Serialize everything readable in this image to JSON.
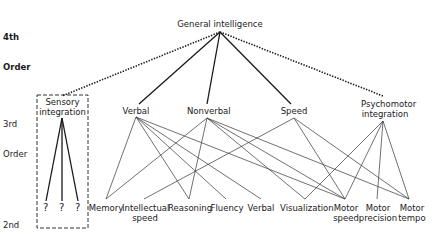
{
  "diagram": {
    "orders": {
      "fourth": {
        "line1": "4th",
        "line2": "Order"
      },
      "third": {
        "line1": "3rd",
        "line2": "Order"
      },
      "second": {
        "line1": "2nd",
        "line2": "Order"
      }
    },
    "fourth_order": {
      "general": "General intelligence"
    },
    "third_order": {
      "sensory": {
        "line1": "Sensory",
        "line2": "integration"
      },
      "verbal": "Verbal",
      "nonverbal": "Nonverbal",
      "speed": "Speed",
      "psychomotor": {
        "line1": "Psychomotor",
        "line2": "integration"
      }
    },
    "second_order": {
      "unknown": [
        "?",
        "?",
        "?"
      ],
      "memory": "Memory",
      "intellectual_speed": {
        "line1": "Intellectual",
        "line2": "speed"
      },
      "reasoning": "Reasoning",
      "fluency": "Fluency",
      "verbal": "Verbal",
      "visualization": "Visualization",
      "motor_speed": {
        "line1": "Motor",
        "line2": "speed"
      },
      "motor_precision": {
        "line1": "Motor",
        "line2": "precision"
      },
      "motor_tempo": {
        "line1": "Motor",
        "line2": "tempo"
      }
    },
    "connections": {
      "general_solid": [
        "Verbal",
        "Nonverbal",
        "Speed"
      ],
      "general_dotted": [
        "Sensory integration",
        "Psychomotor integration"
      ],
      "verbal": [
        "Memory",
        "Reasoning",
        "Fluency",
        "Verbal",
        "Motor speed"
      ],
      "nonverbal": [
        "Memory",
        "Reasoning",
        "Visualization",
        "Motor speed",
        "Motor tempo"
      ],
      "speed": [
        "Intellectual speed",
        "Motor speed",
        "Motor tempo"
      ],
      "psychomotor": [
        "Visualization",
        "Motor speed",
        "Motor precision",
        "Motor tempo"
      ],
      "sensory": [
        "?",
        "?",
        "?"
      ]
    },
    "colors": {
      "ink": "#1a1a1a",
      "background": "#ffffff"
    }
  }
}
